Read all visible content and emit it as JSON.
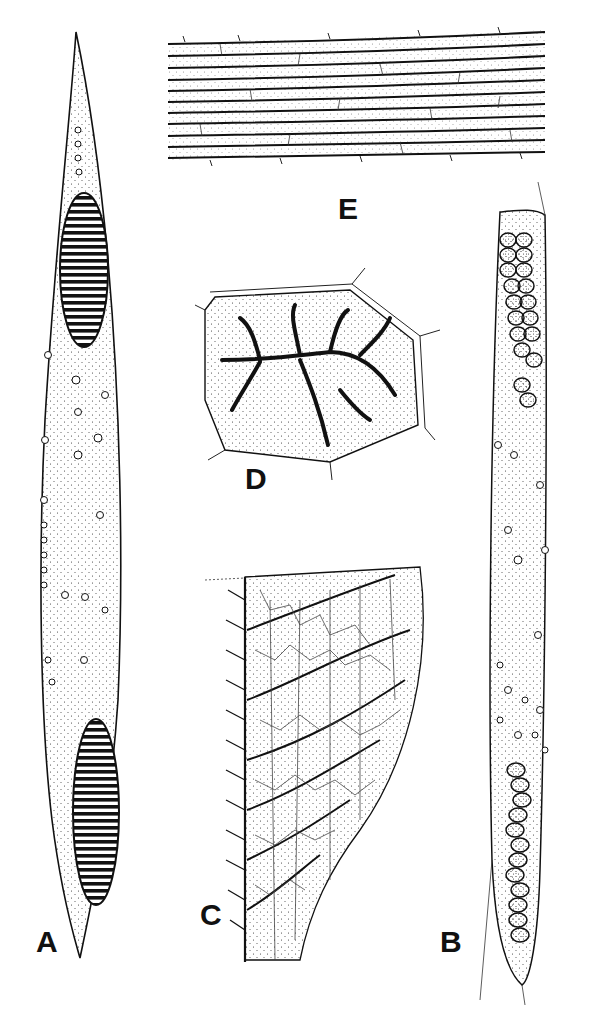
{
  "figure": {
    "type": "scientific line illustration",
    "panels": [
      {
        "id": "A",
        "label": "A",
        "description": "elongated spindle-shaped cell with two striated inclusions and scattered nuclei"
      },
      {
        "id": "B",
        "label": "B",
        "description": "elongated cell filled with clusters of round bodies at both ends"
      },
      {
        "id": "C",
        "label": "C",
        "description": "leaf-like reticulate structure with spiny margin"
      },
      {
        "id": "D",
        "label": "D",
        "description": "polygonal cell with branched dark network"
      },
      {
        "id": "E",
        "label": "E",
        "description": "band of parallel fibres with cross cell walls"
      }
    ]
  },
  "colors": {
    "ink": "#1a1a1a",
    "paper": "#ffffff"
  }
}
